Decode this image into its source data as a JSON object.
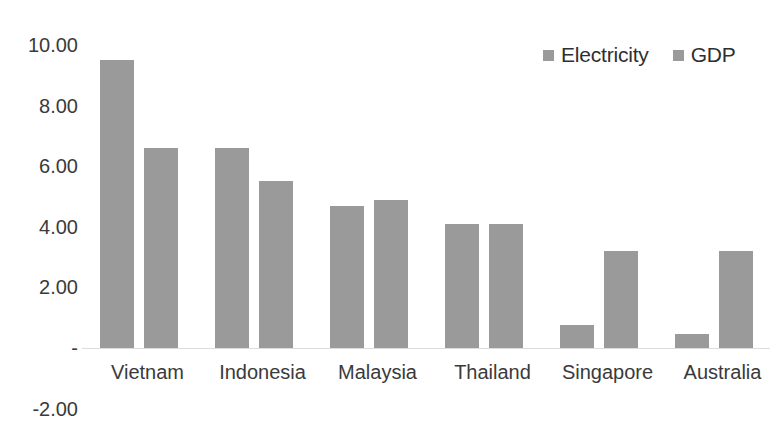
{
  "chart_data": {
    "type": "bar",
    "title": "",
    "subtitle": "",
    "xlabel": "",
    "ylabel": "",
    "categories": [
      "Vietnam",
      "Indonesia",
      "Malaysia",
      "Thailand",
      "Singapore",
      "Australia"
    ],
    "series": [
      {
        "name": "Electricity",
        "values": [
          9.5,
          6.6,
          4.7,
          4.1,
          0.75,
          0.45
        ],
        "color": "#9a9a9a"
      },
      {
        "name": "GDP",
        "values": [
          6.6,
          5.5,
          4.9,
          4.1,
          3.2,
          3.2
        ],
        "color": "#9a9a9a"
      }
    ],
    "ylim": [
      -2.0,
      10.0
    ],
    "yticks": [
      10.0,
      8.0,
      6.0,
      4.0,
      2.0,
      0.0,
      -2.0
    ],
    "ytick_labels": [
      "10.00",
      "8.00",
      "6.00",
      "4.00",
      "2.00",
      "-",
      "-2.00"
    ],
    "grid": false,
    "legend_position": "top-right",
    "legend": [
      "Electricity",
      "GDP"
    ]
  },
  "legend": {
    "entries": [
      {
        "label": "Electricity",
        "swatch_name": "legend-swatch-electricity"
      },
      {
        "label": "GDP",
        "swatch_name": "legend-swatch-gdp"
      }
    ]
  },
  "axis": {
    "y_labels": [
      "10.00",
      "8.00",
      "6.00",
      "4.00",
      "2.00",
      "-",
      "-2.00"
    ],
    "x_labels": [
      "Vietnam",
      "Indonesia",
      "Malaysia",
      "Thailand",
      "Singapore",
      "Australia"
    ]
  },
  "colors": {
    "bar_fill": "#9a9a9a",
    "text": "#3a3a3a",
    "baseline": "#dcdcdc",
    "background": "#ffffff"
  }
}
